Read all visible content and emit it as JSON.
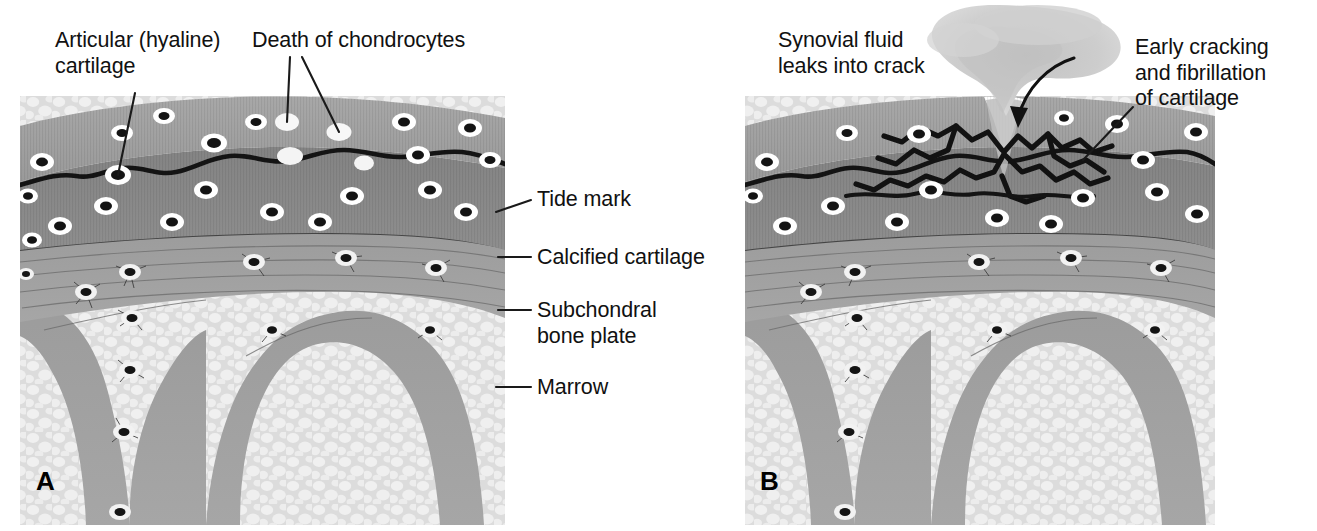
{
  "figure": {
    "type": "medical-illustration",
    "background_color": "#ffffff",
    "panel_count": 2
  },
  "panels": [
    {
      "letter": "A",
      "name": "normal-joint-cartilage",
      "labels": [
        {
          "name": "articular-cartilage",
          "text": "Articular (hyaline)\ncartilage",
          "lines": [
            "Articular (hyaline)",
            "cartilage"
          ],
          "x": 55,
          "y": 28,
          "leader": {
            "from": [
              135,
              93
            ],
            "to": [
              118,
              175
            ]
          }
        },
        {
          "name": "death-of-chondrocytes",
          "text": "Death of chondrocytes",
          "lines": [
            "Death of chondrocytes"
          ],
          "x": 252,
          "y": 28,
          "leader_multi": [
            {
              "from": [
                290,
                57
              ],
              "to": [
                287,
                122
              ]
            },
            {
              "from": [
                302,
                57
              ],
              "to": [
                339,
                132
              ]
            }
          ]
        },
        {
          "name": "tide-mark",
          "text": "Tide mark",
          "lines": [
            "Tide mark"
          ],
          "x": 537,
          "y": 187,
          "leader": {
            "from": [
              531,
              200
            ],
            "to": [
              496,
              212
            ]
          }
        },
        {
          "name": "calcified-cartilage",
          "text": "Calcified cartilage",
          "lines": [
            "Calcified cartilage"
          ],
          "x": 537,
          "y": 245,
          "leader": {
            "from": [
              531,
              257
            ],
            "to": [
              498,
              257
            ]
          }
        },
        {
          "name": "subchondral-bone-plate",
          "text": "Subchondral\nbone plate",
          "lines": [
            "Subchondral",
            "bone plate"
          ],
          "x": 537,
          "y": 298,
          "leader": {
            "from": [
              531,
              310
            ],
            "to": [
              498,
              310
            ]
          }
        },
        {
          "name": "marrow",
          "text": "Marrow",
          "lines": [
            "Marrow"
          ],
          "x": 537,
          "y": 375,
          "leader": {
            "from": [
              531,
              387
            ],
            "to": [
              496,
              387
            ]
          }
        }
      ]
    },
    {
      "letter": "B",
      "name": "osteoarthritic-cartilage-with-crack",
      "labels": [
        {
          "name": "synovial-fluid-leaks",
          "text": "Synovial fluid\nleaks into crack",
          "lines": [
            "Synovial fluid",
            "leaks into crack"
          ],
          "x": 778,
          "y": 28,
          "leader": null
        },
        {
          "name": "early-cracking-fibrillation",
          "text": "Early cracking\nand fibrillation\nof cartilage",
          "lines": [
            "Early cracking",
            "and fibrillation",
            "of cartilage"
          ],
          "x": 1135,
          "y": 35,
          "leader": {
            "from": [
              1133,
              107
            ],
            "to": [
              1083,
              160
            ]
          }
        }
      ],
      "annotations": [
        {
          "name": "fluid-flow-arrow",
          "type": "curved-arrow",
          "description": "arrow curving down into crack mouth"
        }
      ]
    }
  ],
  "tissue_layers": [
    {
      "name": "articular-hyaline-cartilage",
      "color": "#9d9d9d",
      "order": 1
    },
    {
      "name": "tide-mark-line",
      "color": "#1a1a1a",
      "order": 2
    },
    {
      "name": "calcified-cartilage",
      "color": "#7e7e7e",
      "order": 3
    },
    {
      "name": "subchondral-bone-plate",
      "color": "#8a8a8a",
      "order": 4
    },
    {
      "name": "trabecular-bone",
      "color": "#9a9a9a",
      "order": 5
    },
    {
      "name": "marrow",
      "color": "#d8d8d8",
      "order": 6
    },
    {
      "name": "synovial-fluid",
      "color": "#c9c9c9",
      "order": 7
    }
  ],
  "cell_markers": {
    "living-chondrocyte": {
      "nucleus": "#111111",
      "lacuna": "#ffffff"
    },
    "dead-chondrocyte": {
      "nucleus": "none",
      "lacuna": "#f4f4f4"
    },
    "osteocyte": {
      "nucleus": "#141414",
      "lacuna": "#f2f2f2"
    }
  }
}
